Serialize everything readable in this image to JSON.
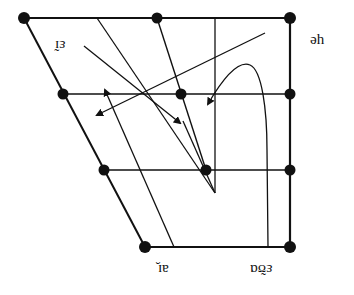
{
  "diagram": {
    "type": "vowel-quadrilateral-diphthongs",
    "orientation": "rotated-180",
    "labels": [
      {
        "id": "ei",
        "text": "ɛ̃ɪ",
        "x": 53,
        "y": 36
      },
      {
        "id": "ue",
        "text": "ɥe",
        "x": 318,
        "y": 34
      },
      {
        "id": "ai",
        "text": "aɪ̯",
        "x": 162,
        "y": 265
      },
      {
        "id": "eau",
        "text": "ɛ̃ʊɑ",
        "x": 253,
        "y": 265
      }
    ],
    "colors": {
      "stroke": "#111111",
      "background": "#ffffff"
    }
  }
}
